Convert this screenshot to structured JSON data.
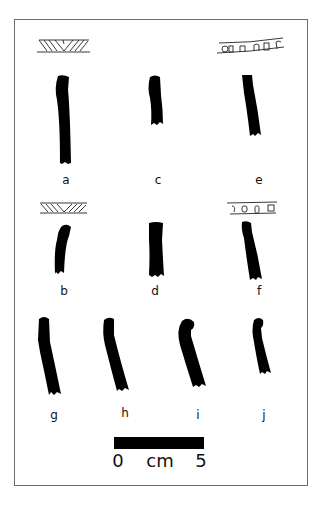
{
  "figure": {
    "type": "archaeological pottery rim profiles",
    "frame_color": "#6e6e6e",
    "ink_color": "#000000",
    "items": [
      {
        "id": "a",
        "label": "a",
        "has_rim_decoration": true,
        "decoration": "incised chevron / diagonal hatching"
      },
      {
        "id": "b",
        "label": "b",
        "has_rim_decoration": true,
        "decoration": "incised chevron / diagonal hatching"
      },
      {
        "id": "c",
        "label": "c",
        "has_rim_decoration": false
      },
      {
        "id": "d",
        "label": "d",
        "has_rim_decoration": false
      },
      {
        "id": "e",
        "label": "e",
        "has_rim_decoration": true,
        "decoration": "row of impressed rectangular / oval notches"
      },
      {
        "id": "f",
        "label": "f",
        "has_rim_decoration": true,
        "decoration": "row of impressed rectangular / oval notches"
      },
      {
        "id": "g",
        "label": "g",
        "has_rim_decoration": false
      },
      {
        "id": "h",
        "label": "h",
        "has_rim_decoration": false
      },
      {
        "id": "i",
        "label": "i",
        "has_rim_decoration": false
      },
      {
        "id": "j",
        "label": "j",
        "has_rim_decoration": false
      }
    ]
  },
  "scale": {
    "start": "0",
    "unit": "cm",
    "end": "5"
  }
}
